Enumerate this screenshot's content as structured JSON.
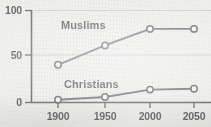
{
  "chart_data": {
    "type": "line",
    "title": "",
    "subtitle": "",
    "xlabel": "",
    "ylabel": "",
    "x": [
      1900,
      1950,
      2000,
      2050
    ],
    "categories": [
      "1900",
      "1950",
      "2000",
      "2050"
    ],
    "xlim": [
      1880,
      2070
    ],
    "ylim": [
      0,
      100
    ],
    "yticks": [
      0,
      50,
      100
    ],
    "ytick_labels": [
      "0",
      "50",
      "100"
    ],
    "xtick_labels": [
      "1900",
      "1950",
      "2000",
      "2050"
    ],
    "grid": "horizontal",
    "legend_position": "inline-labels",
    "series": [
      {
        "name": "Muslims",
        "values": [
          41,
          62,
          80,
          80
        ],
        "marker": "open-circle",
        "color": "#4a4a4a"
      },
      {
        "name": "Christians",
        "values": [
          3,
          6,
          14,
          15
        ],
        "marker": "open-circle",
        "color": "#4a4a4a"
      }
    ],
    "annotations": [
      {
        "text": "Muslims",
        "x": 1925,
        "y": 90
      },
      {
        "text": "Christians",
        "x": 1928,
        "y": 27
      }
    ]
  },
  "axes": {
    "y": {
      "tick_0": "0",
      "tick_50": "50",
      "tick_100": "100"
    },
    "x": {
      "tick_1900": "1900",
      "tick_1950": "1950",
      "tick_2000": "2000",
      "tick_2050": "2050"
    }
  },
  "labels": {
    "muslims": "Muslims",
    "christians": "Christians"
  },
  "colors": {
    "background": "#e8e8e6",
    "line": "#4a4a4a",
    "axis": "#3a3a3a",
    "grid": "#b6b6b4",
    "marker_fill": "#f2f2f0",
    "text": "#2e2e2e"
  }
}
